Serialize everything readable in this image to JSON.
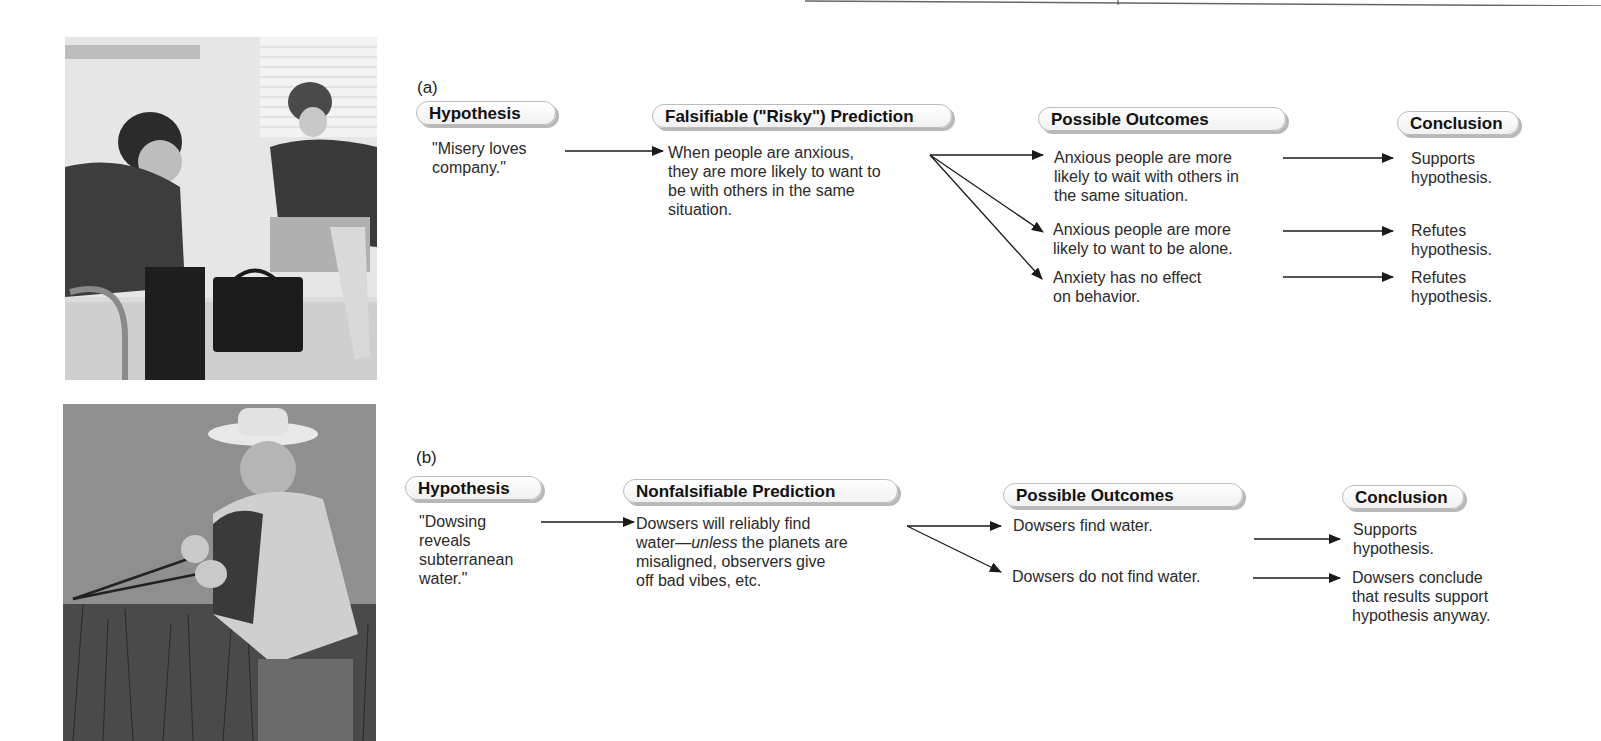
{
  "panel_a": {
    "label": "(a)",
    "photo": {
      "name": "counseling-session-photo",
      "description": "man with head in hands seated across from woman with clipboard"
    },
    "headers": {
      "hypothesis": "Hypothesis",
      "prediction": "Falsifiable (\"Risky\") Prediction",
      "outcomes": "Possible Outcomes",
      "conclusion": "Conclusion"
    },
    "hypothesis_text": [
      "\"Misery loves",
      "company.\""
    ],
    "prediction_text": [
      "When people are anxious,",
      "they are more likely to want to",
      "be with others in the same",
      "situation."
    ],
    "outcomes": [
      {
        "lines": [
          "Anxious people are more",
          "likely to wait with others in",
          "the same situation."
        ],
        "conclusion": [
          "Supports",
          "hypothesis."
        ]
      },
      {
        "lines": [
          "Anxious people are more",
          "likely to want to be alone."
        ],
        "conclusion": [
          "Refutes",
          "hypothesis."
        ]
      },
      {
        "lines": [
          "Anxiety has no effect",
          "on behavior."
        ],
        "conclusion": [
          "Refutes",
          "hypothesis."
        ]
      }
    ]
  },
  "panel_b": {
    "label": "(b)",
    "photo": {
      "name": "dowser-photo",
      "description": "man in straw hat holding divining rods in tall grass"
    },
    "headers": {
      "hypothesis": "Hypothesis",
      "prediction": "Nonfalsifiable Prediction",
      "outcomes": "Possible Outcomes",
      "conclusion": "Conclusion"
    },
    "hypothesis_text": [
      "\"Dowsing",
      "reveals",
      "subterranean",
      "water.\""
    ],
    "prediction_text": {
      "line1": "Dowsers will reliably find",
      "line2_prefix": "water—",
      "line2_italic": "unless",
      "line2_suffix": " the planets are",
      "line3": "misaligned, observers give",
      "line4": "off bad vibes, etc."
    },
    "outcomes": [
      {
        "lines": [
          "Dowsers find water."
        ],
        "conclusion": [
          "Supports",
          "hypothesis."
        ]
      },
      {
        "lines": [
          "Dowsers do not find water."
        ],
        "conclusion": [
          "Dowsers conclude",
          "that results support",
          "hypothesis anyway."
        ]
      }
    ]
  },
  "colors": {
    "text": "#2a2a2a",
    "pill_border": "#bbbbbb",
    "pill_shadow": "#b8b8b8",
    "arrow": "#1a1a1a"
  }
}
